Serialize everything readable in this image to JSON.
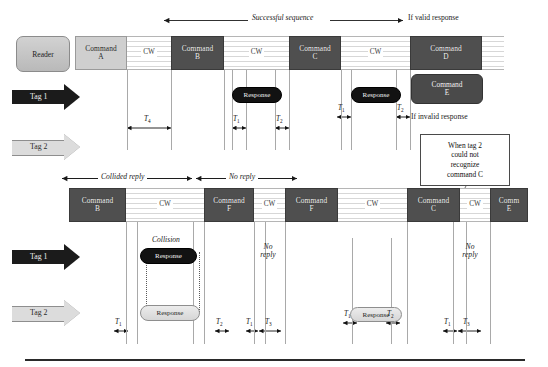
{
  "top_section": {
    "reader_label": "Reader",
    "annotations": {
      "successful_sequence": "Successful sequence",
      "if_valid_response": "If valid response",
      "if_invalid_response": "If invalid response"
    },
    "timeline": [
      {
        "kind": "command",
        "label_line1": "Command",
        "label_line2": "A",
        "shade": "light"
      },
      {
        "kind": "cw",
        "label": "CW"
      },
      {
        "kind": "command",
        "label_line1": "Command",
        "label_line2": "B",
        "shade": "dark"
      },
      {
        "kind": "cw",
        "label": "CW"
      },
      {
        "kind": "command",
        "label_line1": "Command",
        "label_line2": "C",
        "shade": "dark"
      },
      {
        "kind": "cw",
        "label": "CW"
      },
      {
        "kind": "command",
        "label_line1": "Command",
        "label_line2": "D",
        "shade": "dark"
      },
      {
        "kind": "cw",
        "label": ""
      }
    ],
    "tag1": {
      "label": "Tag 1",
      "style": "dark"
    },
    "tag2": {
      "label": "Tag 2",
      "style": "light"
    },
    "responses": [
      {
        "label": "Response",
        "style": "dark",
        "row": "tag1"
      },
      {
        "label": "Response",
        "style": "dark",
        "row": "tag1"
      }
    ],
    "command_e": {
      "label_line1": "Command",
      "label_line2": "E"
    },
    "timings": [
      {
        "name": "T",
        "sub": "4"
      },
      {
        "name": "T",
        "sub": "1"
      },
      {
        "name": "T",
        "sub": "2"
      },
      {
        "name": "T",
        "sub": "1"
      },
      {
        "name": "T",
        "sub": "2"
      }
    ]
  },
  "middle_annotations": {
    "collided_reply": "Collided reply",
    "no_reply": "No reply"
  },
  "callout": {
    "text": "When tag 2 could not recognize command C",
    "line1": "When tag 2",
    "line2": "could not",
    "line3": "recognize",
    "line4": "command C"
  },
  "bottom_section": {
    "timeline": [
      {
        "kind": "command",
        "label_line1": "Command",
        "label_line2": "B",
        "shade": "dark"
      },
      {
        "kind": "cw",
        "label": "CW"
      },
      {
        "kind": "command",
        "label_line1": "Command",
        "label_line2": "F",
        "shade": "dark"
      },
      {
        "kind": "cw",
        "label": "CW"
      },
      {
        "kind": "command",
        "label_line1": "Command",
        "label_line2": "F",
        "shade": "dark"
      },
      {
        "kind": "cw",
        "label": "CW"
      },
      {
        "kind": "command",
        "label_line1": "Command",
        "label_line2": "C",
        "shade": "dark"
      },
      {
        "kind": "cw",
        "label": "CW"
      },
      {
        "kind": "command",
        "label_line1": "Comm",
        "label_line2": "E",
        "shade": "dark"
      }
    ],
    "tag1": {
      "label": "Tag 1",
      "style": "dark"
    },
    "tag2": {
      "label": "Tag 2",
      "style": "light"
    },
    "collision_label": "Collision",
    "no_reply_1": {
      "line1": "No",
      "line2": "reply"
    },
    "no_reply_2": {
      "line1": "No",
      "line2": "reply"
    },
    "responses": [
      {
        "label": "Response",
        "style": "dark",
        "row": "tag1"
      },
      {
        "label": "Response",
        "style": "light",
        "row": "tag2"
      },
      {
        "label": "Response",
        "style": "light",
        "row": "tag2"
      }
    ],
    "timings": [
      {
        "name": "T",
        "sub": "1"
      },
      {
        "name": "T",
        "sub": "2"
      },
      {
        "name": "T",
        "sub": "1"
      },
      {
        "name": "T",
        "sub": "3"
      },
      {
        "name": "T",
        "sub": "1"
      },
      {
        "name": "T",
        "sub": "2"
      },
      {
        "name": "T",
        "sub": "1"
      },
      {
        "name": "T",
        "sub": "3"
      }
    ]
  },
  "colors": {
    "command_dark": "#4f4f4f",
    "command_light": "#cfcfcf",
    "tag1_arrow": "#1b1b1b",
    "tag2_arrow": "#dcdcdc",
    "response_dark": "#121212",
    "response_light": "#e2e2e2",
    "guide_line": "#a9a9a9",
    "text": "#1a1a1a"
  }
}
